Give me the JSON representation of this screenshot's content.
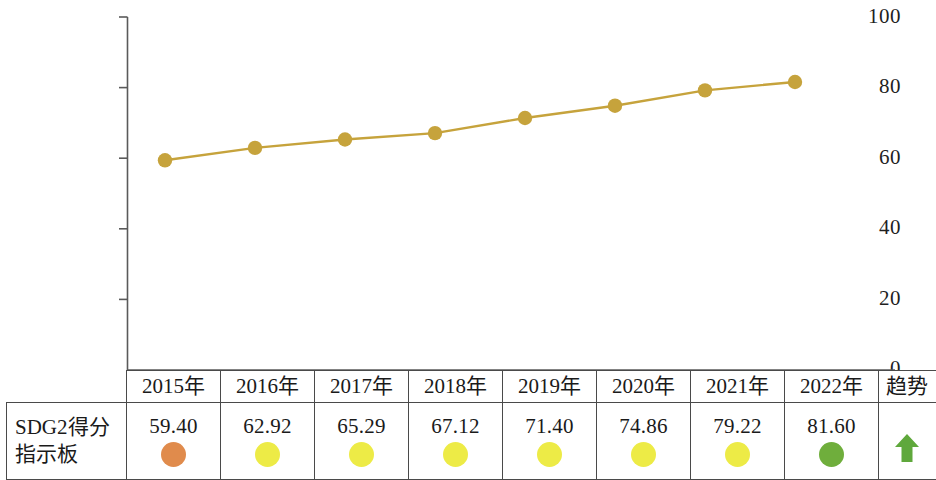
{
  "chart_data": {
    "type": "line",
    "title": "",
    "xlabel": "",
    "ylabel": "",
    "ylim": [
      0,
      100
    ],
    "yticks": [
      "0",
      "20",
      "40",
      "60",
      "80",
      "100"
    ],
    "grid": false,
    "legend": "none",
    "categories": [
      "2015年",
      "2016年",
      "2017年",
      "2018年",
      "2019年",
      "2020年",
      "2021年",
      "2022年"
    ],
    "series": [
      {
        "name": "SDG2得分",
        "values": [
          59.4,
          62.92,
          65.29,
          67.12,
          71.4,
          74.86,
          79.22,
          81.6
        ],
        "color": "#C6A33C",
        "marker": "circle"
      }
    ]
  },
  "table": {
    "row_label": {
      "line1": "SDG2得分",
      "line2": "指示板"
    },
    "headers": [
      "2015年",
      "2016年",
      "2017年",
      "2018年",
      "2019年",
      "2020年",
      "2021年",
      "2022年"
    ],
    "trend_header": "趋势",
    "cells": [
      {
        "value": "59.40",
        "dot_color": "#E08B4C"
      },
      {
        "value": "62.92",
        "dot_color": "#EDEB46"
      },
      {
        "value": "65.29",
        "dot_color": "#EDEB46"
      },
      {
        "value": "67.12",
        "dot_color": "#EDEB46"
      },
      {
        "value": "71.40",
        "dot_color": "#EDEB46"
      },
      {
        "value": "74.86",
        "dot_color": "#EDEB46"
      },
      {
        "value": "79.22",
        "dot_color": "#EDEB46"
      },
      {
        "value": "81.60",
        "dot_color": "#6FAE3C"
      }
    ],
    "trend": {
      "icon": "arrow-up-icon",
      "color": "#5FA83C"
    }
  }
}
